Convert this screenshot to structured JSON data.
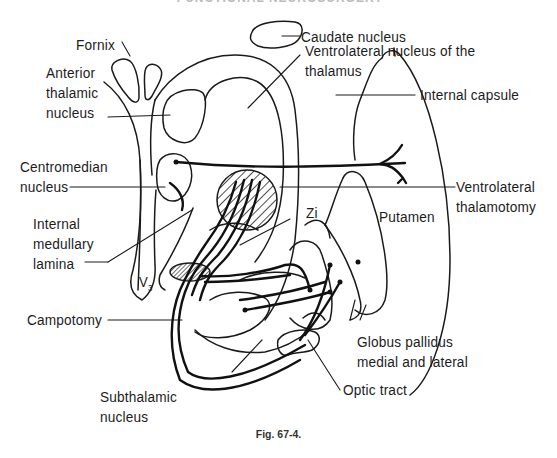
{
  "header": {
    "text": "FUNCTIONAL NEUROSURGERY"
  },
  "caption": "Fig. 67-4.",
  "labels": {
    "fornix": "Fornix",
    "caudate": "Caudate nucleus",
    "anterior": [
      "Anterior",
      "thalamic",
      "nucleus"
    ],
    "vl_nucleus": [
      "Ventrolateral nucleus of the",
      "thalamus"
    ],
    "internal_capsule": "Internal capsule",
    "centromedian": [
      "Centromedian",
      "nucleus"
    ],
    "vl_thalamotomy": [
      "Ventrolateral",
      "thalamotomy"
    ],
    "putamen": "Putamen",
    "zi": "Zi",
    "internal_medullary": [
      "Internal",
      "medullary",
      "lamina"
    ],
    "v3": "V",
    "v3_sub": "3",
    "campotomy": "Campotomy",
    "globus": [
      "Globus pallidus",
      "medial and lateral"
    ],
    "optic": "Optic tract",
    "subthalamic": [
      "Subthalamic",
      "nucleus"
    ]
  },
  "colors": {
    "ink": "#1a1a1a",
    "background": "#ffffff"
  }
}
